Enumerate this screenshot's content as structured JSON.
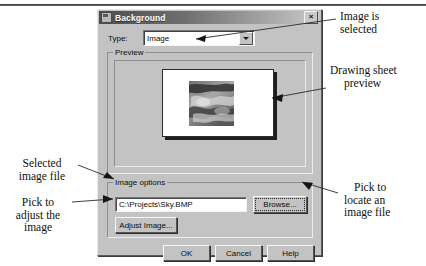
{
  "dialog": {
    "title": "Background",
    "close_label": "×",
    "type_label": "Type:",
    "type_value": "Image",
    "preview_group_label": "Preview",
    "image_options_group_label": "Image options",
    "file_path": "C:\\Projects\\Sky.BMP",
    "browse_button": "Browse...",
    "adjust_image_button": "Adjust Image...",
    "ok_button": "OK",
    "cancel_button": "Cancel",
    "help_button": "Help"
  },
  "annotations": {
    "image_is_selected": [
      "Image is",
      "selected"
    ],
    "drawing_sheet_preview": [
      "Drawing sheet",
      "preview"
    ],
    "pick_to_locate": [
      "Pick to",
      "locate an",
      "image file"
    ],
    "selected_image_file": [
      "Selected",
      "image file"
    ],
    "pick_to_adjust": [
      "Pick to",
      "adjust the",
      "image"
    ]
  },
  "colors": {
    "dialog_face": "#c3c3c3",
    "titlebar_start": "#4c4c4c",
    "titlebar_end": "#c9c9c9",
    "field_bg": "#ffffff",
    "text": "#0b0b0b",
    "leader_line": "#2a2a2a"
  }
}
